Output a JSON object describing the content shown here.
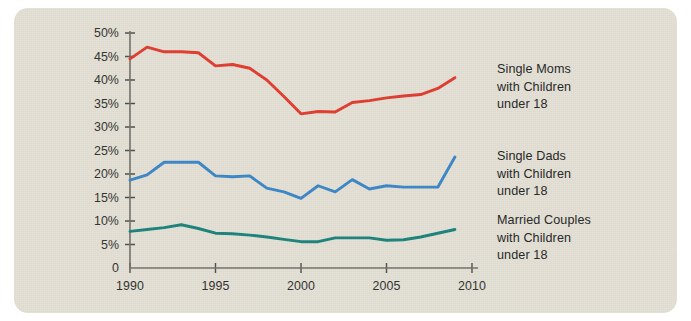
{
  "card": {
    "background_color": "#e2dfd3",
    "page_background": "#ffffff"
  },
  "chart_data": {
    "type": "line",
    "title": "",
    "subtitle": "",
    "xlabel": "",
    "ylabel": "",
    "xlim": [
      1990,
      2010
    ],
    "ylim": [
      0,
      50
    ],
    "grid": false,
    "legend_position": "right",
    "x": [
      1990,
      1991,
      1992,
      1993,
      1994,
      1995,
      1996,
      1997,
      1998,
      1999,
      2000,
      2001,
      2002,
      2003,
      2004,
      2005,
      2006,
      2007,
      2008,
      2009
    ],
    "x_ticks": [
      1990,
      1995,
      2000,
      2005,
      2010
    ],
    "x_tick_labels": [
      "1990",
      "1995",
      "2000",
      "2005",
      "2010"
    ],
    "y_ticks": [
      0,
      5,
      10,
      15,
      20,
      25,
      30,
      35,
      40,
      45,
      50
    ],
    "y_tick_labels": [
      "0",
      "5%",
      "10%",
      "15%",
      "20%",
      "25%",
      "30%",
      "35%",
      "40%",
      "45%",
      "50%"
    ],
    "series": [
      {
        "name": "Single Moms with Children under 18",
        "color": "#e0392c",
        "legend_lines": [
          "Single Moms",
          "with Children",
          "under 18"
        ],
        "values": [
          44.5,
          47.0,
          46.0,
          46.0,
          45.8,
          43.0,
          43.3,
          42.5,
          40.0,
          36.5,
          32.8,
          33.3,
          33.2,
          35.2,
          35.6,
          36.2,
          36.6,
          36.9,
          38.2,
          40.5
        ]
      },
      {
        "name": "Single Dads with Children under 18",
        "color": "#3a85c6",
        "legend_lines": [
          "Single Dads",
          "with Children",
          "under 18"
        ],
        "values": [
          18.7,
          19.8,
          22.5,
          22.5,
          22.5,
          19.6,
          19.4,
          19.6,
          17.0,
          16.2,
          14.8,
          17.5,
          16.2,
          18.8,
          16.8,
          17.5,
          17.2,
          17.2,
          17.2,
          23.6
        ]
      },
      {
        "name": "Married Couples with Children under 18",
        "color": "#18817a",
        "legend_lines": [
          "Married Couples",
          "with Children",
          "under 18"
        ],
        "values": [
          7.8,
          8.2,
          8.6,
          9.2,
          8.4,
          7.4,
          7.3,
          7.0,
          6.6,
          6.1,
          5.6,
          5.6,
          6.4,
          6.4,
          6.4,
          5.9,
          6.0,
          6.6,
          7.4,
          8.2
        ]
      }
    ]
  }
}
